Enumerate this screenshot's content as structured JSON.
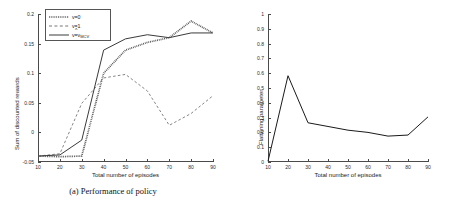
{
  "figure": {
    "panels": [
      {
        "id": "performance-of-policy",
        "caption": "(a) Performance of policy"
      },
      {
        "id": "average-flattening-parameter",
        "caption": "(b) Average flattening parameter"
      }
    ]
  },
  "chart_data": [
    {
      "type": "line",
      "title": "",
      "xlabel": "Total number of episodes",
      "ylabel": "Sum of discounted rewards",
      "x": [
        10,
        20,
        30,
        40,
        50,
        60,
        70,
        80,
        90
      ],
      "xlim": [
        10,
        90
      ],
      "ylim": [
        -0.05,
        0.2
      ],
      "xticks": [
        10,
        20,
        30,
        40,
        50,
        60,
        70,
        80,
        90
      ],
      "xticklabels": [
        "10",
        "20",
        "30",
        "40",
        "50",
        "60",
        "70",
        "80",
        "90"
      ],
      "yticks": [
        -0.05,
        0,
        0.05,
        0.1,
        0.15,
        0.2
      ],
      "yticklabels": [
        "-0.05",
        "0",
        "0.05",
        "0.1",
        "0.15",
        "0.2"
      ],
      "grid": false,
      "legend_position": "upper-left",
      "series": [
        {
          "name": "v=0",
          "style": "dotted",
          "color": "#555555",
          "values": [
            -0.04,
            -0.041,
            -0.04,
            0.1,
            0.139,
            0.152,
            0.16,
            0.188,
            0.168
          ]
        },
        {
          "name": "v=1",
          "style": "dashed",
          "color": "#777777",
          "values": [
            -0.04,
            -0.036,
            0.049,
            0.092,
            0.098,
            0.07,
            0.012,
            0.032,
            0.062
          ]
        },
        {
          "name": "v=v_MCV",
          "style": "solid",
          "color": "#3a3a3a",
          "values": [
            -0.04,
            -0.038,
            -0.013,
            0.139,
            0.158,
            0.165,
            0.16,
            0.168,
            0.168
          ]
        }
      ]
    },
    {
      "type": "line",
      "title": "",
      "xlabel": "Total number of episodes",
      "ylabel": "Flattening parameter",
      "x": [
        10,
        20,
        30,
        40,
        50,
        60,
        70,
        80,
        90
      ],
      "xlim": [
        10,
        90
      ],
      "ylim": [
        0,
        1
      ],
      "xticks": [
        10,
        20,
        30,
        40,
        50,
        60,
        70,
        80,
        90
      ],
      "xticklabels": [
        "10",
        "20",
        "30",
        "40",
        "50",
        "60",
        "70",
        "80",
        "90"
      ],
      "yticks": [
        0,
        0.1,
        0.2,
        0.3,
        0.4,
        0.5,
        0.6,
        0.7,
        0.8,
        0.9,
        1
      ],
      "yticklabels": [
        "0",
        "0.1",
        "0.2",
        "0.3",
        "0.4",
        "0.5",
        "0.6",
        "0.7",
        "0.8",
        "0.9",
        "1"
      ],
      "grid": false,
      "legend_position": "none",
      "series": [
        {
          "name": "flattening-parameter",
          "style": "solid",
          "color": "#1a1a1a",
          "values": [
            0.005,
            0.583,
            0.265,
            0.24,
            0.215,
            0.2,
            0.175,
            0.182,
            0.305
          ]
        }
      ]
    }
  ],
  "legend": {
    "items": [
      {
        "label": "v=0",
        "style": "dotted"
      },
      {
        "label": "v=1",
        "style": "dashed"
      },
      {
        "label": "v=v",
        "sub": "MCV",
        "hat": "^",
        "style": "solid"
      }
    ]
  }
}
